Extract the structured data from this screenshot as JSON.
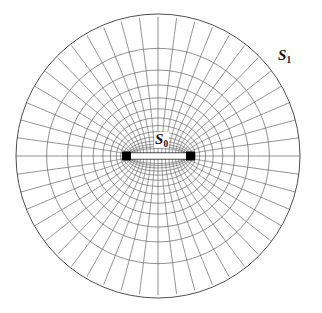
{
  "figure": {
    "background_color": "#ffffff",
    "width": 322,
    "height": 313
  },
  "labels": {
    "inner": {
      "symbol": "S",
      "subscript": "0",
      "full": "S0"
    },
    "outer": {
      "symbol": "S",
      "subscript": "1",
      "full": "S1"
    }
  },
  "chart_data": {
    "type": "line",
    "xlabel": "",
    "ylabel": "",
    "grid": true,
    "legend_position": "none",
    "geometry": {
      "center": [
        158,
        155
      ],
      "outer_radius": 142,
      "outer_boundary_label": "S1",
      "inner_boundary_label": "S0",
      "inner_slit": {
        "x_left": 130,
        "x_right": 187,
        "y_center": 156,
        "half_thickness": 3.2,
        "endpoint_marker": "black-square",
        "endpoint_size": 9
      },
      "radial_lines": 48,
      "ring_lines": 14,
      "mapping": "joukowski-annulus",
      "ring_radii_normalized": [
        0.052,
        0.072,
        0.099,
        0.135,
        0.181,
        0.238,
        0.305,
        0.382,
        0.466,
        0.556,
        0.649,
        0.743,
        0.86,
        1.0
      ]
    },
    "styles": {
      "grid_line_color": "#5f5f5f",
      "grid_line_width": 0.7,
      "outer_line_color": "#3a3a3a",
      "outer_line_width": 0.9,
      "slit_fill": "#ffffff",
      "slit_stroke": "#222222",
      "marker_color": "#000000",
      "background": "#ffffff"
    }
  }
}
